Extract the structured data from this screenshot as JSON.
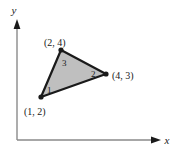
{
  "figure": {
    "background_color": "#ffffff",
    "axes": {
      "x_label": "x",
      "y_label": "y",
      "axis_color": "#8a8a8a",
      "arrow_color": "#1a1a1a",
      "origin_px": [
        17,
        140
      ],
      "x_axis_end_px": [
        160,
        140
      ],
      "y_axis_end_px": [
        17,
        20
      ]
    },
    "shape": {
      "type": "triangle",
      "fill_color": "#bfbfbf",
      "stroke_color": "#1a1a1a",
      "vertex_dot_color": "#1a1a1a",
      "vertices": [
        {
          "label": "(1, 2)",
          "coords": [
            1,
            2
          ],
          "px": [
            41,
            97
          ],
          "label_px": [
            27,
            112
          ]
        },
        {
          "label": "(2, 4)",
          "coords": [
            2,
            4
          ],
          "px": [
            61,
            50
          ],
          "label_px": [
            47,
            44
          ]
        },
        {
          "label": "(4, 3)",
          "coords": [
            4,
            3
          ],
          "px": [
            106,
            74
          ],
          "label_px": [
            113,
            79
          ]
        }
      ],
      "edges": [
        {
          "label": "1",
          "from": "(1, 2)",
          "to": "(4, 3)",
          "label_px": [
            47,
            92
          ]
        },
        {
          "label": "2",
          "from": "(4, 3)",
          "to": "(2, 4)",
          "label_px": [
            93,
            74
          ]
        },
        {
          "label": "3",
          "from": "(2, 4)",
          "to": "(1, 2)",
          "label_px": [
            64,
            64
          ]
        }
      ]
    }
  }
}
